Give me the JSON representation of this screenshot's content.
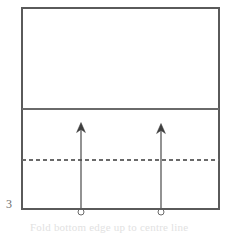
{
  "figure": {
    "step_label": "3",
    "caption": "Fold bottom edge up to centre line",
    "caption_visibility": "clipped",
    "colors": {
      "background": "#ffffff",
      "outline": "#5a5a5a",
      "divider": "#6a6a6a",
      "fold_line": "#6a6a6a",
      "arrow": "#4a4a4a",
      "label_text": "#6d6d6d",
      "caption_text": "#c9c9c9"
    },
    "sheet": {
      "name": "paper-sheet",
      "left": 22,
      "top": 8,
      "right": 219,
      "bottom": 209,
      "width": 197,
      "height": 201
    },
    "divider_line": {
      "name": "horizontal-crease-line",
      "style": "solid",
      "y": 109,
      "x_start": 22,
      "x_end": 219
    },
    "fold_line": {
      "name": "dashed-fold-line",
      "style": "dashed",
      "y": 160,
      "x_start": 22,
      "x_end": 219,
      "dash": 4,
      "gap": 3
    },
    "arrows": [
      {
        "name": "fold-arrow-left",
        "x": 81,
        "tail_y": 209,
        "head_y": 123,
        "direction": "up",
        "has_base_loop": true,
        "loop_y": 212,
        "loop_r": 3
      },
      {
        "name": "fold-arrow-right",
        "x": 161,
        "tail_y": 209,
        "head_y": 124,
        "direction": "up",
        "has_base_loop": true,
        "loop_y": 212,
        "loop_r": 3
      }
    ]
  }
}
